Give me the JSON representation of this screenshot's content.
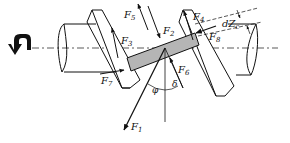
{
  "diagram": {
    "title": "",
    "colors": {
      "line": "#111111",
      "block_fill": "#b5b5b5",
      "background": "#ffffff"
    },
    "rotation_icon": "rotation-arrow-icon",
    "forces": [
      {
        "id": "F1",
        "base": "F",
        "sub": "1"
      },
      {
        "id": "F2",
        "base": "F",
        "sub": "2"
      },
      {
        "id": "F3",
        "base": "F",
        "sub": "3"
      },
      {
        "id": "F4",
        "base": "F",
        "sub": "4"
      },
      {
        "id": "F5",
        "base": "F",
        "sub": "5"
      },
      {
        "id": "F6",
        "base": "F",
        "sub": "6"
      },
      {
        "id": "F7",
        "base": "F",
        "sub": "7"
      },
      {
        "id": "F8",
        "base": "F",
        "sub": "8"
      }
    ],
    "angles": {
      "phi": "φ",
      "delta": "δ"
    },
    "dimension": {
      "base": "dZ",
      "sub": "c"
    }
  }
}
